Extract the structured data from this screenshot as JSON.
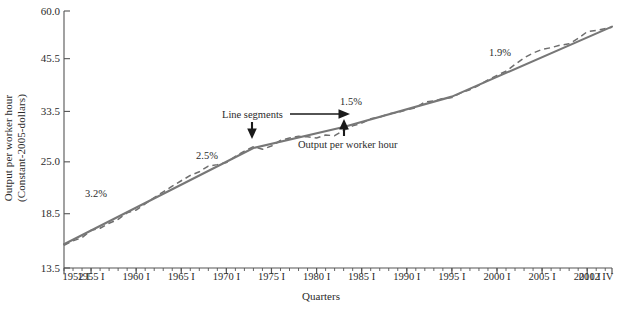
{
  "chart_data": {
    "type": "line",
    "title": "",
    "subtitle": "",
    "xlabel": "Quarters",
    "ylabel": "Output per worker hour (Constant-2005-dollars)",
    "ylabel_line1": "Output per worker hour",
    "ylabel_line2": "(Constant-2005-dollars)",
    "yscale": "log",
    "ylim": [
      13.5,
      60.0
    ],
    "ytick_labels": [
      "60.0",
      "45.5",
      "33.5",
      "25.0",
      "18.5",
      "13.5"
    ],
    "ytick_values": [
      60.0,
      45.5,
      33.5,
      25.0,
      18.5,
      13.5
    ],
    "xtick_labels": [
      "1952 I",
      "1955 I",
      "1960 I",
      "1965 I",
      "1970 I",
      "1975 I",
      "1980 I",
      "1985 I",
      "1990 I",
      "1995 I",
      "2000 I",
      "2005 I",
      "2010 I",
      "2012 IV"
    ],
    "xtick_values": [
      1952.0,
      1955.0,
      1960.0,
      1965.0,
      1970.0,
      1975.0,
      1980.0,
      1985.0,
      1990.0,
      1995.0,
      2000.0,
      2005.0,
      2010.0,
      2012.75
    ],
    "xlim": [
      1952.0,
      2012.75
    ],
    "grid": false,
    "legend_position": "none",
    "series": [
      {
        "name": "Output per worker hour",
        "style": "dashed",
        "color": "#6e6e6e",
        "x": [
          1952.0,
          1953.0,
          1954.0,
          1955.0,
          1956.0,
          1957.0,
          1958.0,
          1959.0,
          1960.0,
          1961.0,
          1962.0,
          1963.0,
          1964.0,
          1965.0,
          1966.0,
          1967.0,
          1968.0,
          1969.0,
          1970.0,
          1971.0,
          1972.0,
          1973.0,
          1974.0,
          1975.0,
          1976.0,
          1977.0,
          1978.0,
          1979.0,
          1980.0,
          1981.0,
          1982.0,
          1983.0,
          1984.0,
          1985.0,
          1986.0,
          1987.0,
          1988.0,
          1989.0,
          1990.0,
          1991.0,
          1992.0,
          1993.0,
          1994.0,
          1995.0,
          1996.0,
          1997.0,
          1998.0,
          1999.0,
          2000.0,
          2001.0,
          2002.0,
          2003.0,
          2004.0,
          2005.0,
          2006.0,
          2007.0,
          2008.0,
          2009.0,
          2010.0,
          2011.0,
          2012.75
        ],
        "y": [
          15.4,
          15.8,
          16.1,
          16.8,
          17.0,
          17.5,
          17.9,
          18.6,
          18.9,
          19.6,
          20.3,
          21.0,
          21.7,
          22.4,
          23.1,
          23.6,
          24.4,
          24.6,
          24.9,
          25.8,
          26.6,
          27.3,
          26.9,
          27.4,
          28.3,
          28.7,
          29.0,
          28.9,
          28.7,
          29.2,
          29.1,
          30.0,
          30.8,
          31.3,
          32.1,
          32.4,
          33.0,
          33.3,
          33.8,
          34.2,
          35.4,
          35.6,
          36.1,
          36.3,
          37.3,
          38.0,
          39.0,
          40.2,
          41.3,
          42.3,
          44.0,
          45.7,
          47.0,
          48.0,
          48.5,
          49.2,
          49.6,
          51.2,
          53.2,
          53.6,
          54.6
        ]
      },
      {
        "name": "Line segments",
        "style": "solid",
        "color": "#777777",
        "breakpoints_x": [
          1952.0,
          1973.0,
          1983.0,
          1995.0,
          2012.75
        ],
        "breakpoints_y": [
          15.5,
          27.1,
          30.6,
          36.5,
          54.8
        ]
      }
    ],
    "annotations": [
      {
        "label": "3.2%",
        "x_px": 85,
        "y_px": 188,
        "segment": "1952 I - 1973"
      },
      {
        "label": "2.5%",
        "x_px": 196,
        "y_px": 150,
        "segment": "1973 - 1983"
      },
      {
        "label": "1.5%",
        "x_px": 340,
        "y_px": 96,
        "segment": "1983 - 1995"
      },
      {
        "label": "1.9%",
        "x_px": 489,
        "y_px": 47,
        "segment": "1995 - 2012 IV"
      },
      {
        "label": "Line segments",
        "x_px": 222,
        "y_px": 109,
        "kind": "callout"
      },
      {
        "label": "Output per worker hour",
        "x_px": 298,
        "y_px": 139,
        "kind": "callout"
      }
    ]
  },
  "axes": {
    "y_title_line1": "Output per worker hour",
    "y_title_line2": "(Constant-2005-dollars)",
    "x_title": "Quarters"
  },
  "colors": {
    "line_segments": "#777777",
    "data_line": "#6e6e6e",
    "axis": "#555555",
    "text": "#2b2b2b",
    "background": "#ffffff"
  }
}
